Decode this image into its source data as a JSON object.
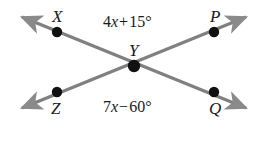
{
  "figure": {
    "kind": "intersecting-lines-angle-diagram",
    "width": 254,
    "height": 163,
    "background_color": "#FFFFFF",
    "line_color": "#808080",
    "dot_color": "#111111",
    "text_color": "#1A1A1A"
  },
  "points": {
    "x": {
      "label": "X",
      "cx": 57,
      "cy": 32,
      "label_x": 52,
      "label_y": 8
    },
    "p": {
      "label": "P",
      "cx": 214,
      "cy": 32,
      "label_x": 210,
      "label_y": 8
    },
    "y": {
      "label": "Y",
      "cx": 134,
      "cy": 66,
      "label_x": 129,
      "label_y": 42
    },
    "z": {
      "label": "Z",
      "cx": 57,
      "cy": 92,
      "label_x": 51,
      "label_y": 100
    },
    "q": {
      "label": "Q",
      "cx": 214,
      "cy": 92,
      "label_x": 209,
      "label_y": 100
    }
  },
  "angles": {
    "top": {
      "name": "angle-XYP",
      "coefficient": "4",
      "variable": "x",
      "operator": "+",
      "constant": "15",
      "degree_symbol": "°",
      "full_text": "4x + 15°",
      "x": 103,
      "y": 14
    },
    "bottom": {
      "name": "angle-ZYQ",
      "coefficient": "7",
      "variable": "x",
      "operator": "−",
      "constant": "60",
      "degree_symbol": "°",
      "full_text": "7x − 60°",
      "x": 103,
      "y": 99
    }
  },
  "lines": [
    {
      "name": "line-XQ",
      "through": [
        "X",
        "Y",
        "Q"
      ],
      "start_arrow": true,
      "end_arrow": true
    },
    {
      "name": "line-ZP",
      "through": [
        "Z",
        "Y",
        "P"
      ],
      "start_arrow": true,
      "end_arrow": true
    }
  ]
}
